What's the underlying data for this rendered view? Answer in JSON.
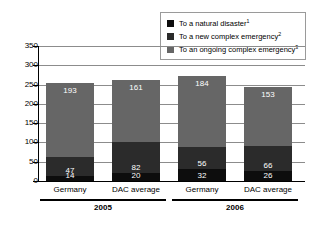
{
  "chart_data": {
    "type": "bar",
    "stacked": true,
    "title": "",
    "xlabel": "",
    "ylabel": "",
    "ylim": [
      0,
      350
    ],
    "yticks": [
      0,
      50,
      100,
      150,
      200,
      250,
      300,
      350
    ],
    "grid": true,
    "legend_position": "top-right",
    "categories": [
      "Germany",
      "DAC average",
      "Germany",
      "DAC average"
    ],
    "groups": [
      {
        "label": "2005",
        "categories": [
          "Germany",
          "DAC average"
        ]
      },
      {
        "label": "2006",
        "categories": [
          "Germany",
          "DAC average"
        ]
      }
    ],
    "series": [
      {
        "name": "To a natural disaster",
        "footnote": "1",
        "color": "#0d0d0d",
        "values": [
          14,
          20,
          32,
          26
        ]
      },
      {
        "name": "To a new complex emergency",
        "footnote": "2",
        "color": "#2b2b2b",
        "values": [
          47,
          82,
          56,
          66
        ]
      },
      {
        "name": "To an ongoing complex emergency",
        "footnote": "3",
        "color": "#666666",
        "values": [
          193,
          161,
          184,
          153
        ]
      }
    ],
    "totals": [
      254,
      263,
      272,
      245
    ]
  },
  "legend": {
    "items": [
      {
        "label": "To a natural disaster",
        "sup": "1",
        "swatch": "legend-swatch-natural-disaster"
      },
      {
        "label": "To a new complex emergency",
        "sup": "2",
        "swatch": "legend-swatch-new-complex-emergency"
      },
      {
        "label": "To an ongoing complex emergency",
        "sup": "3",
        "swatch": "legend-swatch-ongoing-complex-emergency"
      }
    ]
  },
  "axis": {
    "y_tick_labels": [
      "350",
      "300",
      "250",
      "200",
      "150",
      "100",
      "50",
      "0"
    ]
  },
  "bars": [
    {
      "category": "Germany",
      "group": "2005",
      "natural_disaster": "14",
      "new_complex": "47",
      "ongoing_complex": "193"
    },
    {
      "category": "DAC average",
      "group": "2005",
      "natural_disaster": "20",
      "new_complex": "82",
      "ongoing_complex": "161"
    },
    {
      "category": "Germany",
      "group": "2006",
      "natural_disaster": "32",
      "new_complex": "56",
      "ongoing_complex": "184"
    },
    {
      "category": "DAC average",
      "group": "2006",
      "natural_disaster": "26",
      "new_complex": "66",
      "ongoing_complex": "153"
    }
  ],
  "groups": [
    {
      "year": "2005"
    },
    {
      "year": "2006"
    }
  ],
  "colors": {
    "natural_disaster": "#0d0d0d",
    "new_complex": "#2b2b2b",
    "ongoing_complex": "#666666",
    "gridline": "#8c8c8c",
    "axis": "#000000",
    "legend_border": "#9a9a9a"
  }
}
